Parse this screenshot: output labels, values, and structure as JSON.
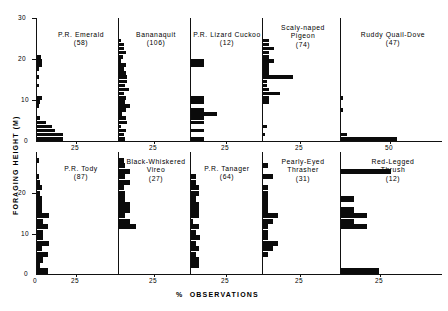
{
  "figure": {
    "xlabel": "%  OBSERVATIONS",
    "ylabel": "FORAGING HEIGHT (M)",
    "y_ticks": [
      "0",
      "10",
      "20",
      "30"
    ],
    "y_ticks_bottom": [
      "0",
      "10",
      "20"
    ],
    "x_tick_main": "25",
    "x_tick_zero": "0",
    "x_tick_50": "50"
  },
  "chart_data": {
    "type": "bar",
    "title": "",
    "xlabel": "% OBSERVATIONS",
    "ylabel": "FORAGING HEIGHT (M)",
    "orientation": "horizontal",
    "ylim": [
      0,
      30
    ],
    "xlim": [
      0,
      25
    ],
    "grid": false,
    "legend": false,
    "bin_width_m": 1,
    "note": "Each panel is a horizontal histogram of foraging height (m) versus percent of observations. Sample size in parentheses.",
    "panels": [
      {
        "name": "P.R. Emerald",
        "title_lines": [
          "P.R. Emerald"
        ],
        "n": 58,
        "sample_label": "(58)",
        "row": 0,
        "col": 0,
        "xlim": [
          0,
          25
        ],
        "x_ticks": [
          0,
          25
        ],
        "bins_m": [
          0,
          1,
          2,
          3,
          4,
          5,
          6,
          7,
          8,
          9,
          10,
          11,
          12,
          13,
          14,
          15,
          16,
          17,
          18,
          19,
          20,
          21,
          22,
          23,
          24,
          25,
          26,
          27,
          28,
          29
        ],
        "values": [
          17,
          17,
          12,
          10,
          6,
          2,
          0,
          0,
          1.5,
          2,
          3.5,
          0,
          0,
          1.5,
          0,
          1.5,
          0,
          1.5,
          3.5,
          3.5,
          2.5,
          0,
          0,
          0,
          0,
          0,
          0,
          0,
          0,
          0
        ]
      },
      {
        "name": "Bananaquit",
        "title_lines": [
          "Bananaquit"
        ],
        "n": 106,
        "sample_label": "(106)",
        "row": 0,
        "col": 1,
        "xlim": [
          0,
          25
        ],
        "x_ticks": [
          0,
          25
        ],
        "bins_m": [
          0,
          1,
          2,
          3,
          4,
          5,
          6,
          7,
          8,
          9,
          10,
          11,
          12,
          13,
          14,
          15,
          16,
          17,
          18,
          19,
          20,
          21,
          22,
          23,
          24,
          25,
          26,
          27,
          28,
          29
        ],
        "values": [
          4,
          3,
          4.5,
          1.5,
          5,
          4.5,
          2,
          4.5,
          7.5,
          4,
          4.5,
          3,
          6.5,
          4,
          5.5,
          5,
          4.5,
          3,
          4.5,
          1.5,
          2.5,
          4.5,
          3.5,
          3,
          1.5,
          0,
          0,
          0,
          0,
          0
        ]
      },
      {
        "name": "P.R. Lizard Cuckoo",
        "title_lines": [
          "P.R. Lizard Cuckoo"
        ],
        "n": 12,
        "sample_label": "(12)",
        "row": 0,
        "col": 2,
        "xlim": [
          0,
          25
        ],
        "x_ticks": [
          0,
          25
        ],
        "bins_m": [
          0,
          1,
          2,
          3,
          4,
          5,
          6,
          7,
          8,
          9,
          10,
          11,
          12,
          13,
          14,
          15,
          16,
          17,
          18,
          19,
          20,
          21,
          22,
          23,
          24,
          25,
          26,
          27,
          28,
          29
        ],
        "values": [
          8.5,
          0,
          8.5,
          0,
          8.5,
          8.5,
          17,
          8.5,
          0,
          8.5,
          8.5,
          0,
          0,
          0,
          0,
          0,
          0,
          0,
          8.5,
          8.5,
          0,
          0,
          0,
          0,
          0,
          0,
          0,
          0,
          0,
          0
        ]
      },
      {
        "name": "Scaly-naped Pigeon",
        "title_lines": [
          "Scaly-naped",
          "Pigeon"
        ],
        "n": 74,
        "sample_label": "(74)",
        "row": 0,
        "col": 3,
        "xlim": [
          0,
          25
        ],
        "x_ticks": [
          0,
          25
        ],
        "bins_m": [
          0,
          1,
          2,
          3,
          4,
          5,
          6,
          7,
          8,
          9,
          10,
          11,
          12,
          13,
          14,
          15,
          16,
          17,
          18,
          19,
          20,
          21,
          22,
          23,
          24,
          25,
          26,
          27,
          28,
          29
        ],
        "values": [
          0,
          1,
          0,
          2.5,
          0,
          0,
          0,
          0,
          0,
          4,
          4,
          11,
          4,
          2.5,
          2.5,
          20,
          4,
          4,
          4,
          7,
          4,
          4,
          7,
          4,
          4,
          0,
          0,
          0,
          0,
          0
        ]
      },
      {
        "name": "Ruddy Quail-Dove",
        "title_lines": [
          "Ruddy Quail-Dove"
        ],
        "n": 47,
        "sample_label": "(47)",
        "row": 0,
        "col": 4,
        "xlim": [
          0,
          60
        ],
        "x_ticks": [
          0,
          50
        ],
        "bins_m": [
          0,
          1,
          2,
          3,
          4,
          5,
          6,
          7,
          8,
          9,
          10,
          11,
          12,
          13,
          14,
          15,
          16,
          17,
          18,
          19,
          20,
          21,
          22,
          23,
          24,
          25,
          26,
          27,
          28,
          29
        ],
        "values": [
          57,
          6,
          0,
          0,
          0,
          0,
          0,
          2.5,
          0,
          0,
          2.5,
          0,
          0,
          0,
          0,
          0,
          0,
          0,
          0,
          0,
          0,
          0,
          0,
          0,
          0,
          0,
          0,
          0,
          0,
          0
        ]
      },
      {
        "name": "P.R. Tody",
        "title_lines": [
          "P.R. Tody"
        ],
        "n": 87,
        "sample_label": "(87)",
        "row": 1,
        "col": 0,
        "xlim": [
          0,
          25
        ],
        "x_ticks": [
          0,
          25
        ],
        "bins_m": [
          0,
          1,
          2,
          3,
          4,
          5,
          6,
          7,
          8,
          9,
          10,
          11,
          12,
          13,
          14,
          15,
          16,
          17,
          18,
          19,
          20,
          21
        ],
        "values": [
          7,
          2,
          4,
          7,
          3,
          8,
          4,
          4,
          7,
          4,
          8,
          3,
          3,
          3,
          2,
          3,
          2,
          1,
          0,
          0,
          1.5,
          0
        ]
      },
      {
        "name": "Black-Whiskered Vireo",
        "title_lines": [
          "Black-Whiskered",
          "Vireo"
        ],
        "n": 27,
        "sample_label": "(27)",
        "row": 1,
        "col": 1,
        "xlim": [
          0,
          25
        ],
        "x_ticks": [
          0,
          25
        ],
        "bins_m": [
          0,
          1,
          2,
          3,
          4,
          5,
          6,
          7,
          8,
          9,
          10,
          11,
          12,
          13,
          14,
          15,
          16,
          17,
          18,
          19,
          20,
          21
        ],
        "values": [
          0,
          0,
          0,
          0,
          0,
          0,
          0,
          0,
          11,
          7,
          4,
          7,
          7,
          4,
          4,
          3.5,
          7,
          4,
          7,
          4,
          3.5,
          0
        ]
      },
      {
        "name": "P.R. Tanager",
        "title_lines": [
          "P.R. Tanager"
        ],
        "n": 64,
        "sample_label": "(64)",
        "row": 1,
        "col": 2,
        "xlim": [
          0,
          25
        ],
        "x_ticks": [
          0,
          25
        ],
        "bins_m": [
          0,
          1,
          2,
          3,
          4,
          5,
          6,
          7,
          8,
          9,
          10,
          11,
          12,
          13,
          14,
          15,
          16,
          17,
          18,
          19,
          20,
          21
        ],
        "values": [
          0,
          5,
          5,
          3,
          5,
          3,
          6,
          3,
          5,
          1.5,
          5,
          5,
          5,
          3,
          5,
          5,
          3,
          3,
          0,
          0,
          0,
          0
        ]
      },
      {
        "name": "Pearly-Eyed Thrasher",
        "title_lines": [
          "Pearly-Eyed",
          "Thrasher"
        ],
        "n": 31,
        "sample_label": "(31)",
        "row": 1,
        "col": 3,
        "xlim": [
          0,
          25
        ],
        "x_ticks": [
          0,
          25
        ],
        "bins_m": [
          0,
          1,
          2,
          3,
          4,
          5,
          6,
          7,
          8,
          9,
          10,
          11,
          12,
          13,
          14,
          15,
          16,
          17,
          18,
          19,
          20,
          21
        ],
        "values": [
          0,
          0,
          0,
          3,
          6.5,
          10,
          3,
          3,
          3,
          6.5,
          10,
          3,
          3,
          3,
          3,
          3,
          0,
          6.5,
          0,
          3,
          0,
          0
        ]
      },
      {
        "name": "Red-Legged Thrush",
        "title_lines": [
          "Red-Legged",
          "Thrush"
        ],
        "n": 12,
        "sample_label": "(12)",
        "row": 1,
        "col": 4,
        "xlim": [
          0,
          25
        ],
        "x_ticks": [
          0,
          25
        ],
        "bins_m": [
          0,
          1,
          2,
          3,
          4,
          5,
          6,
          7,
          8,
          9,
          10,
          11,
          12,
          13,
          14,
          15,
          16,
          17,
          18,
          19,
          20,
          21
        ],
        "values": [
          25,
          0,
          0,
          0,
          0,
          0,
          0,
          0,
          17,
          8.5,
          17,
          8.5,
          0,
          8.5,
          0,
          0,
          0,
          0,
          33,
          0,
          0,
          0
        ]
      }
    ]
  }
}
